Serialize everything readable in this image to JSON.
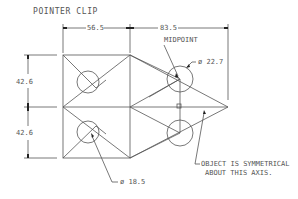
{
  "title": "POINTER CLIP",
  "dimensions": {
    "top_left_width": "56.5",
    "top_right_width": "83.5",
    "left_upper_height": "42.6",
    "left_lower_height": "42.6"
  },
  "callouts": {
    "midpoint": "MIDPOINT",
    "large_hole": "ø 22.7",
    "small_hole": "ø 18.5",
    "symmetry_line1": "OBJECT IS SYMMETRICAL",
    "symmetry_line2": "ABOUT THIS AXIS."
  },
  "colors": {
    "line": "#444444",
    "text": "#555555",
    "background": "#ffffff"
  }
}
